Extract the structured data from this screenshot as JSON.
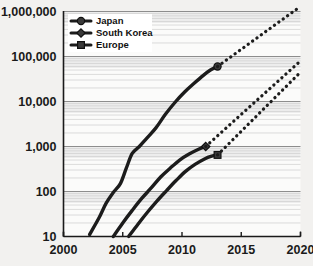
{
  "chart_data": {
    "type": "line",
    "title": "",
    "xlabel": "",
    "ylabel": "",
    "yscale": "log",
    "xlim": [
      2000,
      2020
    ],
    "ylim": [
      10,
      1000000
    ],
    "grid": true,
    "legend_position": "top-left",
    "y_ticks": [
      "10",
      "100",
      "1,000",
      "10,000",
      "100,000",
      "1,000,000"
    ],
    "y_tick_values": [
      10,
      100,
      1000,
      10000,
      100000,
      1000000
    ],
    "x_ticks": [
      "2000",
      "2005",
      "2010",
      "2015",
      "2020"
    ],
    "x_tick_values": [
      2000,
      2005,
      2010,
      2015,
      2020
    ],
    "series": [
      {
        "name": "Japan",
        "marker": "circle",
        "style": "solid",
        "x": [
          2002.2,
          2003.0,
          2003.6,
          2004.2,
          2004.8,
          2005.3,
          2005.8,
          2006.4,
          2007.0,
          2007.8,
          2008.6,
          2009.4,
          2010.2,
          2011.0,
          2011.8,
          2012.4,
          2013.0
        ],
        "values": [
          11,
          26,
          55,
          95,
          150,
          330,
          700,
          1000,
          1500,
          2600,
          5200,
          9500,
          16000,
          25000,
          38000,
          50000,
          60000
        ],
        "end_marker_x": 2013.0,
        "end_marker_value": 60000
      },
      {
        "name": "Japan projection",
        "style": "dotted",
        "x": [
          2013.0,
          2020.0
        ],
        "values": [
          60000,
          1300000
        ]
      },
      {
        "name": "South Korea",
        "marker": "diamond",
        "style": "solid",
        "x": [
          2004.2,
          2005.0,
          2005.8,
          2006.6,
          2007.4,
          2008.2,
          2009.0,
          2009.8,
          2010.6,
          2011.4,
          2012.0
        ],
        "values": [
          10,
          20,
          38,
          70,
          120,
          210,
          330,
          500,
          680,
          870,
          1000
        ],
        "end_marker_x": 2012.0,
        "end_marker_value": 1000
      },
      {
        "name": "South Korea projection",
        "style": "dotted",
        "x": [
          2012.0,
          2020.0
        ],
        "values": [
          1000,
          80000
        ]
      },
      {
        "name": "Europe",
        "marker": "square",
        "style": "solid",
        "x": [
          2005.5,
          2006.3,
          2007.1,
          2007.9,
          2008.7,
          2009.5,
          2010.3,
          2011.1,
          2011.9,
          2012.5,
          2013.0
        ],
        "values": [
          10,
          19,
          35,
          62,
          105,
          175,
          280,
          400,
          530,
          610,
          650
        ],
        "end_marker_x": 2013.0,
        "end_marker_value": 650
      },
      {
        "name": "Europe projection",
        "style": "dotted",
        "x": [
          2013.0,
          2020.0
        ],
        "values": [
          650,
          45000
        ]
      }
    ],
    "legend": [
      {
        "label": "Japan",
        "marker": "circle"
      },
      {
        "label": "South Korea",
        "marker": "diamond"
      },
      {
        "label": "Europe",
        "marker": "square"
      }
    ]
  }
}
